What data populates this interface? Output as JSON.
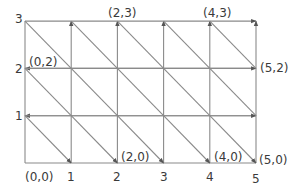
{
  "diagram": {
    "type": "triangulated-grid",
    "grid": {
      "cols": 5,
      "rows": 3
    },
    "x_ticks": [
      "1",
      "2",
      "3",
      "4",
      "5"
    ],
    "y_ticks": [
      "1",
      "2",
      "3"
    ],
    "point_labels": [
      {
        "text": "(0,0)",
        "x": 0,
        "y": 0
      },
      {
        "text": "(2,0)",
        "x": 2,
        "y": 0
      },
      {
        "text": "(4,0)",
        "x": 4,
        "y": 0
      },
      {
        "text": "(5,0)",
        "x": 5,
        "y": 0
      },
      {
        "text": "(0,2)",
        "x": 0,
        "y": 2
      },
      {
        "text": "(5,2)",
        "x": 5,
        "y": 2
      },
      {
        "text": "(2,3)",
        "x": 2,
        "y": 3
      },
      {
        "text": "(4,3)",
        "x": 4,
        "y": 3
      }
    ],
    "colors": {
      "line": "#8a8a8a",
      "text": "#3a3a3a",
      "background": "#ffffff"
    }
  }
}
